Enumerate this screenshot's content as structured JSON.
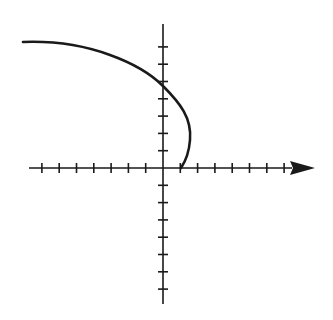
{
  "diagram": {
    "type": "coordinate-graph",
    "colors": {
      "ink": "#1a1a1a",
      "background": "#ffffff"
    },
    "axes": {
      "origin_px": [
        163,
        168
      ],
      "tick_spacing_px": 17.3,
      "x_axis": {
        "left_px": 29,
        "right_tip_px": 315,
        "arrow": "right",
        "ticks_negative": 7,
        "ticks_positive": 7
      },
      "y_axis": {
        "top_px": 24,
        "bottom_px": 304,
        "arrow": "none",
        "ticks_positive": 7,
        "ticks_negative": 7
      }
    },
    "curve": {
      "approx_points_units": [
        [
          -8,
          7.3
        ],
        [
          -4.8,
          7.1
        ],
        [
          0,
          4.7
        ],
        [
          1.6,
          1.9
        ],
        [
          1,
          0
        ]
      ],
      "start_px": [
        23,
        42
      ],
      "y_intercept_px": [
        163,
        86
      ],
      "max_x_px": [
        190,
        135
      ],
      "end_px": [
        181,
        168
      ]
    }
  }
}
